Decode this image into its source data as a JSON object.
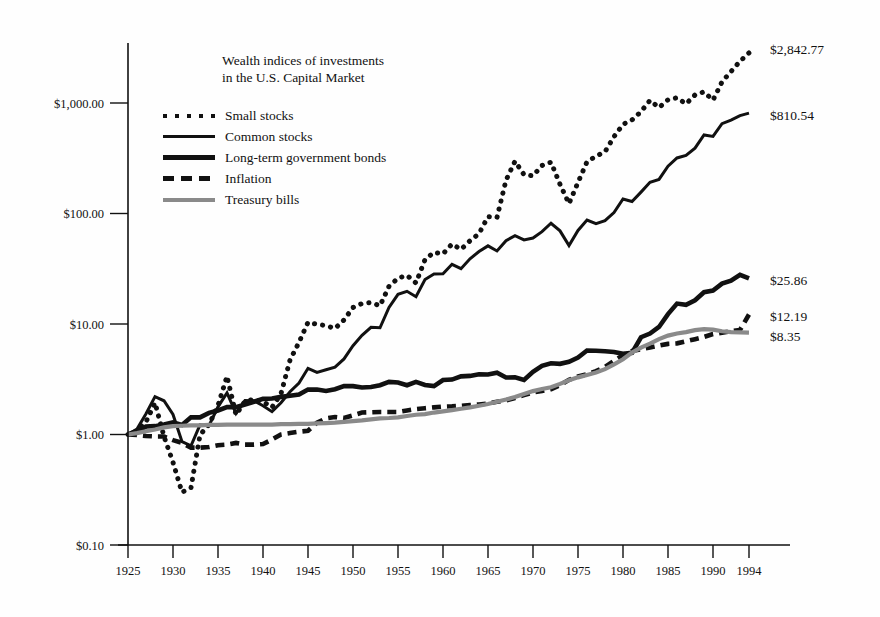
{
  "legend": {
    "title_line1": "Wealth indices of investments",
    "title_line2": "in the U.S. Capital Market",
    "items": [
      {
        "label": "Small stocks",
        "key": "dotted-line-key"
      },
      {
        "label": "Common stocks",
        "key": "thin-solid-line-key"
      },
      {
        "label": "Long-term government bonds",
        "key": "thick-solid-line-key"
      },
      {
        "label": "Inflation",
        "key": "dashed-line-key"
      },
      {
        "label": "Treasury bills",
        "key": "gray-solid-line-key"
      }
    ]
  },
  "end_labels": [
    {
      "text": "$2,842.77",
      "series": "Small stocks"
    },
    {
      "text": "$810.54",
      "series": "Common stocks"
    },
    {
      "text": "$25.86",
      "series": "Long-term government bonds"
    },
    {
      "text": "$12.19",
      "series": "Inflation"
    },
    {
      "text": "$8.35",
      "series": "Treasury bills"
    }
  ],
  "chart_data": {
    "type": "line",
    "title": "Wealth indices of investments in the U.S. Capital Market",
    "xlabel": "",
    "ylabel": "",
    "yscale": "log",
    "ylim": [
      0.1,
      3000
    ],
    "xlim": [
      1925,
      1994
    ],
    "grid": false,
    "legend_position": "upper-left-inside",
    "ytick_labels": [
      "$1,000.00",
      "$100.00",
      "$10.00",
      "$1.00",
      "$0.10"
    ],
    "ytick_values": [
      1000,
      100,
      10,
      1,
      0.1
    ],
    "xtick_labels": [
      "1925",
      "1930",
      "1935",
      "1940",
      "1945",
      "1950",
      "1955",
      "1960",
      "1965",
      "1970",
      "1975",
      "1980",
      "1985",
      "1990",
      "1994"
    ],
    "xtick_values": [
      1925,
      1930,
      1935,
      1940,
      1945,
      1950,
      1955,
      1960,
      1965,
      1970,
      1975,
      1980,
      1985,
      1990,
      1994
    ],
    "x": [
      1925,
      1926,
      1927,
      1928,
      1929,
      1930,
      1931,
      1932,
      1933,
      1934,
      1935,
      1936,
      1937,
      1938,
      1939,
      1940,
      1941,
      1942,
      1943,
      1944,
      1945,
      1946,
      1947,
      1948,
      1949,
      1950,
      1951,
      1952,
      1953,
      1954,
      1955,
      1956,
      1957,
      1958,
      1959,
      1960,
      1961,
      1962,
      1963,
      1964,
      1965,
      1966,
      1967,
      1968,
      1969,
      1970,
      1971,
      1972,
      1973,
      1974,
      1975,
      1976,
      1977,
      1978,
      1979,
      1980,
      1981,
      1982,
      1983,
      1984,
      1985,
      1986,
      1987,
      1988,
      1989,
      1990,
      1991,
      1992,
      1993,
      1994
    ],
    "series": [
      {
        "name": "Small stocks",
        "style": "dotted",
        "color": "#111111",
        "final_value": 2842.77,
        "values": [
          1.0,
          1.07,
          1.3,
          1.94,
          0.96,
          0.56,
          0.3,
          0.33,
          0.99,
          1.23,
          1.83,
          3.37,
          1.51,
          2.0,
          2.08,
          1.99,
          1.76,
          2.34,
          4.72,
          6.82,
          10.36,
          9.95,
          9.66,
          9.11,
          10.89,
          14.1,
          15.32,
          15.65,
          14.63,
          21.94,
          25.97,
          27.54,
          23.53,
          38.3,
          44.5,
          43.13,
          52.91,
          47.3,
          56.67,
          65.73,
          93.74,
          92.17,
          200.0,
          297.6,
          224.43,
          219.1,
          271.86,
          291.5,
          183.8,
          122.7,
          191.36,
          294.3,
          329.8,
          361.5,
          495.9,
          639.8,
          702.7,
          834.2,
          1057.0,
          909.0,
          1070.0,
          1116.0,
          982.0,
          1183.0,
          1261.0,
          1062.0,
          1553.0,
          1925.0,
          2385.0,
          2842.77
        ]
      },
      {
        "name": "Common stocks",
        "style": "thin-solid",
        "color": "#111111",
        "final_value": 810.54,
        "values": [
          1.0,
          1.12,
          1.54,
          2.2,
          2.02,
          1.52,
          0.86,
          0.79,
          1.22,
          1.2,
          1.78,
          2.38,
          1.55,
          2.03,
          2.02,
          1.82,
          1.61,
          1.94,
          2.44,
          2.92,
          3.97,
          3.65,
          3.85,
          4.07,
          4.83,
          6.36,
          7.89,
          9.34,
          9.24,
          14.11,
          18.57,
          19.78,
          17.65,
          25.3,
          28.32,
          28.46,
          34.7,
          31.67,
          38.89,
          45.29,
          50.95,
          45.81,
          56.79,
          63.1,
          57.72,
          60.0,
          68.57,
          81.6,
          69.66,
          51.21,
          70.28,
          87.12,
          80.88,
          86.19,
          102.1,
          135.2,
          128.5,
          156.2,
          191.5,
          203.6,
          268.1,
          318.2,
          334.9,
          390.6,
          514.2,
          498.2,
          650.0,
          699.4,
          769.8,
          810.54
        ]
      },
      {
        "name": "Long-term government bonds",
        "style": "thick-solid",
        "color": "#111111",
        "final_value": 25.86,
        "values": [
          1.0,
          1.08,
          1.18,
          1.19,
          1.23,
          1.29,
          1.22,
          1.43,
          1.43,
          1.57,
          1.65,
          1.77,
          1.77,
          1.87,
          1.98,
          2.1,
          2.12,
          2.19,
          2.24,
          2.3,
          2.55,
          2.55,
          2.48,
          2.57,
          2.74,
          2.74,
          2.66,
          2.69,
          2.79,
          2.99,
          2.95,
          2.79,
          2.99,
          2.81,
          2.74,
          3.11,
          3.14,
          3.36,
          3.39,
          3.51,
          3.49,
          3.62,
          3.28,
          3.29,
          3.12,
          3.69,
          4.18,
          4.41,
          4.36,
          4.55,
          4.96,
          5.76,
          5.72,
          5.66,
          5.59,
          5.37,
          5.48,
          7.59,
          8.19,
          9.4,
          12.3,
          15.3,
          14.9,
          16.4,
          19.4,
          20.1,
          23.2,
          24.7,
          27.9,
          25.86
        ]
      },
      {
        "name": "Inflation",
        "style": "dashed",
        "color": "#111111",
        "final_value": 12.19,
        "values": [
          1.0,
          0.99,
          0.97,
          0.96,
          0.96,
          0.89,
          0.84,
          0.76,
          0.76,
          0.77,
          0.8,
          0.81,
          0.84,
          0.81,
          0.81,
          0.82,
          0.9,
          1.0,
          1.03,
          1.06,
          1.08,
          1.28,
          1.4,
          1.44,
          1.41,
          1.49,
          1.58,
          1.59,
          1.6,
          1.6,
          1.6,
          1.65,
          1.7,
          1.73,
          1.76,
          1.79,
          1.8,
          1.82,
          1.85,
          1.87,
          1.91,
          1.98,
          2.04,
          2.14,
          2.27,
          2.4,
          2.48,
          2.57,
          2.79,
          3.13,
          3.35,
          3.51,
          3.75,
          4.09,
          4.64,
          5.22,
          5.69,
          5.91,
          6.13,
          6.37,
          6.61,
          6.68,
          6.98,
          7.29,
          7.63,
          8.1,
          8.35,
          8.6,
          8.84,
          12.19
        ]
      },
      {
        "name": "Treasury bills",
        "style": "gray-solid",
        "color": "#8a8a8a",
        "final_value": 8.35,
        "values": [
          1.0,
          1.03,
          1.07,
          1.11,
          1.16,
          1.19,
          1.2,
          1.21,
          1.21,
          1.22,
          1.22,
          1.23,
          1.23,
          1.23,
          1.23,
          1.23,
          1.23,
          1.24,
          1.24,
          1.25,
          1.25,
          1.26,
          1.27,
          1.28,
          1.3,
          1.32,
          1.34,
          1.37,
          1.4,
          1.41,
          1.43,
          1.47,
          1.51,
          1.53,
          1.58,
          1.62,
          1.66,
          1.71,
          1.76,
          1.82,
          1.89,
          1.98,
          2.07,
          2.18,
          2.32,
          2.47,
          2.58,
          2.68,
          2.87,
          3.1,
          3.29,
          3.46,
          3.64,
          3.9,
          4.31,
          4.8,
          5.52,
          6.11,
          6.65,
          7.3,
          7.85,
          8.2,
          8.45,
          8.8,
          9.0,
          8.9,
          8.6,
          8.45,
          8.4,
          8.35
        ]
      }
    ]
  },
  "colors": {
    "ink": "#111111",
    "gray_series": "#8a8a8a",
    "background": "#fefefe"
  }
}
